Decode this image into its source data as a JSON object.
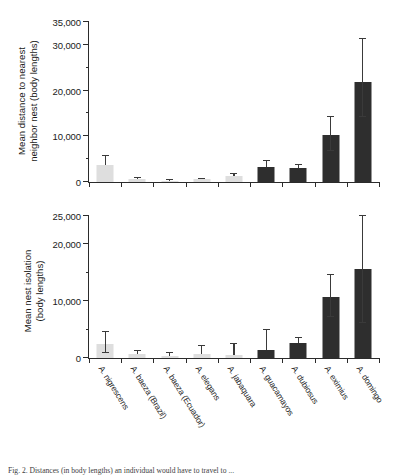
{
  "figure": {
    "caption": "Fig. 2. Distances (in body lengths) an individual would have to travel to ... ",
    "background": "#ffffff",
    "colors": {
      "light_bar": "#dedede",
      "dark_bar": "#2e2e2e",
      "axis": "#2b2b2b",
      "error_bar": "#3a3a3a"
    }
  },
  "chart_data": [
    {
      "id": "top",
      "type": "bar",
      "title": "",
      "ylabel": "Mean distance to nearest neighbor nest (body lengths)",
      "ylabel_line1": "Mean distance to nearest",
      "ylabel_line2": "neighbor nest (body lengths)",
      "xlabel": "",
      "ylim": [
        0,
        35000
      ],
      "yticks": [
        0,
        5000,
        10000,
        15000,
        20000,
        25000,
        30000,
        35000
      ],
      "ytick_labels": [
        "0",
        "",
        "10,000",
        "",
        "20,000",
        "",
        "30,000",
        "35,000"
      ],
      "ytick_major": [
        0,
        10000,
        20000,
        30000,
        35000
      ],
      "grid": false,
      "legend": false,
      "categories": [
        "A. nigrescens",
        "A. baeza (Brazil)",
        "A. baeza (Ecuador)",
        "A. elegans",
        "A. jabaquara",
        "A. guacamayos",
        "A. dubiosus",
        "A. eximius",
        "A. domingo"
      ],
      "values": [
        3700,
        620,
        230,
        560,
        1250,
        3250,
        3050,
        10200,
        21900
      ],
      "err_upper": [
        2000,
        250,
        120,
        200,
        600,
        1250,
        700,
        4100,
        9300
      ],
      "err_lower": [
        0,
        0,
        0,
        0,
        0,
        0,
        0,
        3500,
        7600
      ],
      "bar_shades": [
        "light",
        "light",
        "light",
        "light",
        "light",
        "dark",
        "dark",
        "dark",
        "dark"
      ]
    },
    {
      "id": "bottom",
      "type": "bar",
      "title": "",
      "ylabel": "Mean nest isolation (body lengths)",
      "ylabel_line1": "Mean nest isolation",
      "ylabel_line2": "(body lengths)",
      "xlabel": "",
      "ylim": [
        0,
        25000
      ],
      "yticks": [
        0,
        5000,
        10000,
        15000,
        20000,
        25000
      ],
      "ytick_labels": [
        "0",
        "",
        "10,000",
        "",
        "20,000",
        "25,000"
      ],
      "ytick_major": [
        0,
        10000,
        20000,
        25000
      ],
      "grid": false,
      "legend": false,
      "categories": [
        "A. nigrescens",
        "A. baeza (Brazil)",
        "A. baeza (Ecuador)",
        "A. elegans",
        "A. jabaquara",
        "A. guacamayos",
        "A. dubiosus",
        "A. eximius",
        "A. domingo"
      ],
      "values": [
        2500,
        620,
        330,
        640,
        600,
        1450,
        2600,
        10800,
        15600
      ],
      "err_upper": [
        2100,
        700,
        500,
        1500,
        1900,
        3450,
        900,
        3800,
        9400
      ],
      "err_lower": [
        1600,
        0,
        0,
        0,
        0,
        0,
        0,
        3600,
        9500
      ],
      "bar_shades": [
        "light",
        "light",
        "light",
        "light",
        "light",
        "dark",
        "dark",
        "dark",
        "dark"
      ]
    }
  ]
}
